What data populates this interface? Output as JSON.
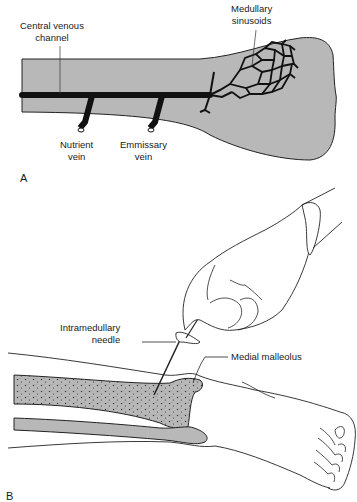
{
  "figure": {
    "panel_a": {
      "panel_label": "A",
      "labels": {
        "central_venous_channel": [
          "Central venous",
          "channel"
        ],
        "medullary_sinusoids": [
          "Medullary",
          "sinusoids"
        ],
        "nutrient_vein": [
          "Nutrient",
          "vein"
        ],
        "emmissary_vein": [
          "Emmissary",
          "vein"
        ]
      }
    },
    "panel_b": {
      "panel_label": "B",
      "labels": {
        "intramedullary_needle": [
          "Intramedullary",
          "needle"
        ],
        "medial_malleolus": "Medial malleolus"
      }
    },
    "colors": {
      "bone_fill": "#b8b8b8",
      "vessel": "#111111",
      "outline": "#222222",
      "background": "#ffffff"
    }
  }
}
